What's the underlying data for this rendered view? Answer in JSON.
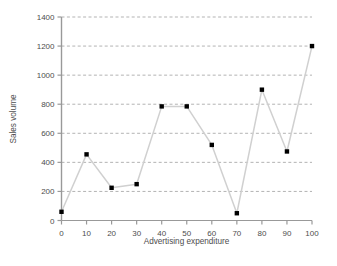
{
  "chart_data": {
    "type": "scatter",
    "title": "",
    "xlabel": "Advertising expenditure",
    "ylabel": "Sales volume",
    "x": [
      0,
      10,
      20,
      30,
      40,
      50,
      60,
      70,
      80,
      90,
      100
    ],
    "values": [
      60,
      455,
      225,
      250,
      785,
      785,
      520,
      50,
      900,
      475,
      1200
    ],
    "series": [
      {
        "name": "Sales volume",
        "values": [
          60,
          455,
          225,
          250,
          785,
          785,
          520,
          50,
          900,
          475,
          1200
        ]
      }
    ],
    "xlim": [
      0,
      100
    ],
    "ylim": [
      0,
      1400
    ],
    "xticks": [
      0,
      10,
      20,
      30,
      40,
      50,
      60,
      70,
      80,
      90,
      100
    ],
    "yticks": [
      0,
      200,
      400,
      600,
      800,
      1000,
      1200,
      1400
    ],
    "xtick_labels": [
      "0",
      "10",
      "20",
      "30",
      "40",
      "50",
      "60",
      "70",
      "80",
      "90",
      "100"
    ],
    "ytick_labels": [
      "0",
      "200",
      "400",
      "600",
      "800",
      "1000",
      "1200",
      "1400"
    ],
    "grid": "horizontal-dashed",
    "legend": "none",
    "line_color": "#d0d0d0",
    "marker_color": "#000000",
    "marker_shape": "square",
    "axis_color": "#999999",
    "text_color": "#4d4d4d",
    "grid_color": "#b3b3b3",
    "background": "#ffffff"
  },
  "caption": {
    "text": ""
  }
}
